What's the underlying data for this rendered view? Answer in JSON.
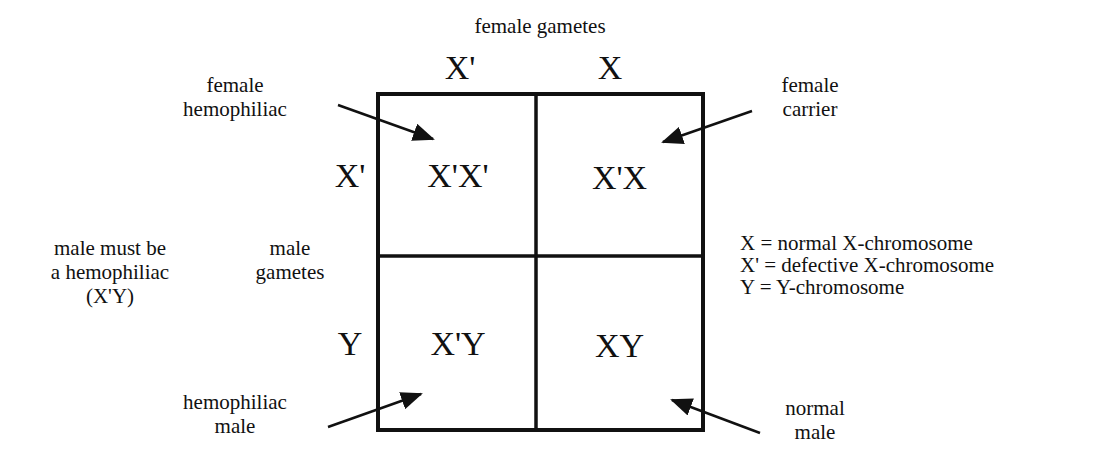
{
  "diagram": {
    "type": "punnett-square",
    "top_title": "female gametes",
    "column_headers": [
      "X'",
      "X"
    ],
    "side_title": [
      "male",
      "gametes"
    ],
    "row_headers": [
      "X'",
      "Y"
    ],
    "cells": [
      [
        "X'X'",
        "X'X"
      ],
      [
        "X'Y",
        "XY"
      ]
    ],
    "callouts": {
      "female_hemophiliac": [
        "female",
        "hemophiliac"
      ],
      "female_carrier": [
        "female",
        "carrier"
      ],
      "hemophiliac_male": [
        "hemophiliac",
        "male"
      ],
      "normal_male": [
        "normal",
        "male"
      ]
    },
    "note": [
      "male must be",
      "a hemophiliac",
      "(X'Y)"
    ],
    "legend": [
      "X = normal X-chromosome",
      "X' = defective X-chromosome",
      "Y = Y-chromosome"
    ],
    "colors": {
      "line": "#111111",
      "background": "#ffffff"
    }
  }
}
